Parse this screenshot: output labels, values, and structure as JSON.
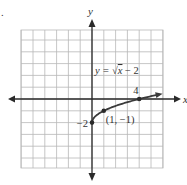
{
  "figure_marker": ".",
  "chart_data": {
    "type": "line",
    "title": "",
    "xlabel": "x",
    "ylabel": "y",
    "xlim": [
      -7,
      5
    ],
    "ylim": [
      -6,
      6
    ],
    "grid": true,
    "function_label": {
      "prefix": "y = ",
      "radical": "√",
      "radicand": "x",
      "suffix": " − 2"
    },
    "series": [
      {
        "name": "y = √x − 2",
        "x": [
          0,
          0.25,
          0.5,
          1,
          2,
          3,
          4,
          5,
          6
        ],
        "y": [
          -2,
          -1.5,
          -1.293,
          -1,
          -0.586,
          -0.268,
          0,
          0.236,
          0.449
        ]
      }
    ],
    "points": [
      {
        "x": 0,
        "y": -2,
        "label": "−2",
        "label_pos": "left"
      },
      {
        "x": 1,
        "y": -1,
        "label": "(1, −1)",
        "label_pos": "below-right"
      },
      {
        "x": 4,
        "y": 0,
        "label": "4",
        "label_pos": "above"
      }
    ]
  }
}
